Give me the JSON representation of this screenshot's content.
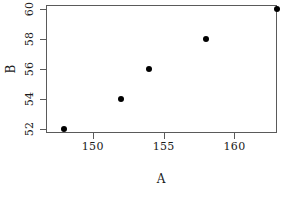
{
  "chart_data": {
    "type": "scatter",
    "title": "",
    "xlabel": "A",
    "ylabel": "B",
    "x": [
      148,
      152,
      154,
      158,
      163
    ],
    "y": [
      52,
      54,
      56,
      58,
      60
    ],
    "points": [
      {
        "x": 148,
        "y": 52
      },
      {
        "x": 152,
        "y": 54
      },
      {
        "x": 154,
        "y": 56
      },
      {
        "x": 158,
        "y": 58
      },
      {
        "x": 163,
        "y": 60
      }
    ],
    "xticks": [
      150,
      155,
      160
    ],
    "yticks": [
      52,
      54,
      56,
      58,
      60
    ],
    "xtick_labels": [
      "150",
      "155",
      "160"
    ],
    "ytick_labels": [
      "52",
      "54",
      "56",
      "58",
      "60"
    ],
    "xlim": [
      146.7,
      163.0
    ],
    "ylim": [
      51.7,
      60.3
    ],
    "grid": false,
    "legend": null,
    "marker": "filled-circle",
    "marker_color": "#000000",
    "box_border_color": "#5a5a5a",
    "background_color": "#ffffff"
  },
  "figure": {
    "x_axis_title": "A",
    "y_axis_title": "B"
  }
}
